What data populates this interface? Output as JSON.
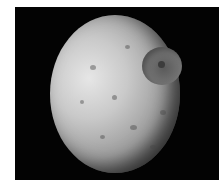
{
  "image": {
    "subject": "Cratered moon (Mimas) on black background",
    "background_color": "#030303",
    "moon_color": "#c9c9c9",
    "crater_feature": "large impact crater with central peak"
  }
}
